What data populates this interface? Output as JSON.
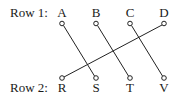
{
  "diagram": {
    "row1": {
      "label": "Row 1:",
      "items": [
        {
          "label": "A",
          "x": 62
        },
        {
          "label": "B",
          "x": 96
        },
        {
          "label": "C",
          "x": 130
        },
        {
          "label": "D",
          "x": 164
        }
      ]
    },
    "row2": {
      "label": "Row 2:",
      "items": [
        {
          "label": "R",
          "x": 62
        },
        {
          "label": "S",
          "x": 96
        },
        {
          "label": "T",
          "x": 130
        },
        {
          "label": "V",
          "x": 164
        }
      ]
    },
    "connections": [
      {
        "from": "A",
        "to": "S"
      },
      {
        "from": "B",
        "to": "T"
      },
      {
        "from": "C",
        "to": "V"
      },
      {
        "from": "D",
        "to": "R"
      }
    ],
    "colors": {
      "line": "#222222",
      "text": "#1a1a1a",
      "background": "#ffffff"
    }
  }
}
